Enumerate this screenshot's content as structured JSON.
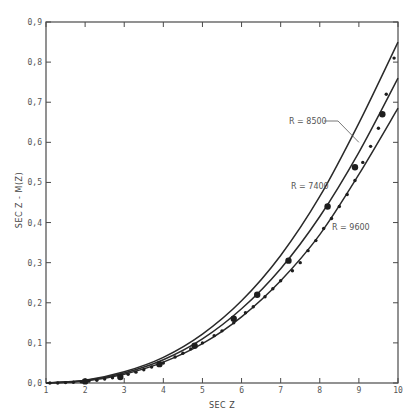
{
  "chart_data": {
    "type": "line",
    "title": "",
    "xlabel": "SEC Z",
    "ylabel": "SEC Z - M(Z)",
    "xlim": [
      1,
      10
    ],
    "ylim": [
      0,
      0.9
    ],
    "x_ticks": [
      "1",
      "2",
      "3",
      "4",
      "5",
      "6",
      "7",
      "8",
      "9",
      "10"
    ],
    "y_ticks": [
      "0.0",
      "0.1",
      "0.2",
      "0.3",
      "0.4",
      "0.5",
      "0.6",
      "0.7",
      "0.8",
      "0.9"
    ],
    "grid": false,
    "legend": "none (curves labeled inline)",
    "series": [
      {
        "name": "R = 7400",
        "kind": "curve",
        "x": [
          1,
          2,
          3,
          4,
          5,
          6,
          7,
          8,
          9,
          10
        ],
        "y": [
          0.0,
          0.006,
          0.025,
          0.058,
          0.11,
          0.185,
          0.285,
          0.415,
          0.575,
          0.76
        ]
      },
      {
        "name": "R = 8500",
        "kind": "curve",
        "x": [
          1,
          2,
          3,
          4,
          5,
          6,
          7,
          8,
          9,
          10
        ],
        "y": [
          0.0,
          0.007,
          0.028,
          0.064,
          0.122,
          0.205,
          0.318,
          0.465,
          0.648,
          0.85
        ]
      },
      {
        "name": "R = 9600",
        "kind": "curve",
        "x": [
          1,
          2,
          3,
          4,
          5,
          6,
          7,
          8,
          9,
          10
        ],
        "y": [
          0.0,
          0.005,
          0.022,
          0.052,
          0.098,
          0.165,
          0.255,
          0.37,
          0.52,
          0.685
        ]
      },
      {
        "name": "observed (small dots)",
        "kind": "scatter",
        "marker": "small",
        "x": [
          1.1,
          1.3,
          1.5,
          1.7,
          1.9,
          2.1,
          2.3,
          2.5,
          2.7,
          2.9,
          3.1,
          3.3,
          3.5,
          3.7,
          4.0,
          4.3,
          4.5,
          4.7,
          5.0,
          5.3,
          5.5,
          5.8,
          6.1,
          6.3,
          6.6,
          6.8,
          7.0,
          7.3,
          7.5,
          7.7,
          7.9,
          8.1,
          8.3,
          8.5,
          8.7,
          8.9,
          9.1,
          9.3,
          9.5,
          9.7,
          9.9
        ],
        "y": [
          0.0,
          0.0,
          0.001,
          0.002,
          0.003,
          0.005,
          0.007,
          0.01,
          0.013,
          0.017,
          0.022,
          0.027,
          0.033,
          0.04,
          0.05,
          0.065,
          0.074,
          0.085,
          0.1,
          0.118,
          0.13,
          0.15,
          0.175,
          0.19,
          0.215,
          0.235,
          0.255,
          0.28,
          0.3,
          0.33,
          0.355,
          0.385,
          0.41,
          0.44,
          0.47,
          0.505,
          0.55,
          0.59,
          0.635,
          0.72,
          0.81
        ]
      },
      {
        "name": "observed (large dots)",
        "kind": "scatter",
        "marker": "large",
        "x": [
          2.0,
          2.9,
          3.9,
          4.8,
          5.8,
          6.4,
          7.2,
          8.2,
          8.9,
          9.6
        ],
        "y": [
          0.004,
          0.015,
          0.047,
          0.093,
          0.16,
          0.22,
          0.305,
          0.44,
          0.538,
          0.67
        ]
      }
    ],
    "annotations": [
      {
        "text": "R = 8500",
        "leader_line_to": {
          "x": 9.0,
          "y": 0.6
        }
      },
      {
        "text": "R = 7400"
      },
      {
        "text": "R = 9600"
      }
    ]
  }
}
